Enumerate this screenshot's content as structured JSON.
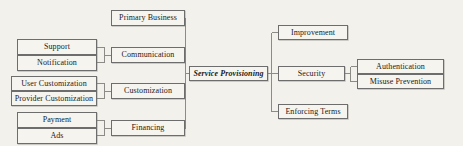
{
  "diagram": {
    "center": {
      "label": "Service Provisioning",
      "italic": true
    },
    "colors": {
      "box_border": "#6d6d6d",
      "box_fill": "#f6f4ef",
      "link": "#8d8b86",
      "background": "#f3f1ec",
      "text": "#1a1a1a"
    },
    "left_branches": [
      {
        "label": "Primary Business",
        "children": []
      },
      {
        "label": "Communication",
        "children": [
          "Support",
          "Notification"
        ]
      },
      {
        "label": "Customization",
        "children": [
          "User Customization",
          "Provider Customization"
        ]
      },
      {
        "label": "Financing",
        "children": [
          "Payment",
          "Ads"
        ]
      }
    ],
    "right_branches": [
      {
        "label": "Improvement",
        "children": []
      },
      {
        "label": "Security",
        "children": [
          "Authentication",
          "Misuse Prevention"
        ]
      },
      {
        "label": "Enforcing Terms",
        "children": []
      }
    ],
    "nodes": {
      "primary_business": "Primary Business",
      "communication": "Communication",
      "customization": "Customization",
      "financing": "Financing",
      "support": "Support",
      "notification": "Notification",
      "user_customization": "User Customization",
      "provider_customization": "Provider Customization",
      "payment": "Payment",
      "ads": "Ads",
      "improvement": "Improvement",
      "security": "Security",
      "enforcing_terms": "Enforcing Terms",
      "authentication": "Authentication",
      "misuse_prevention": "Misuse Prevention"
    }
  }
}
